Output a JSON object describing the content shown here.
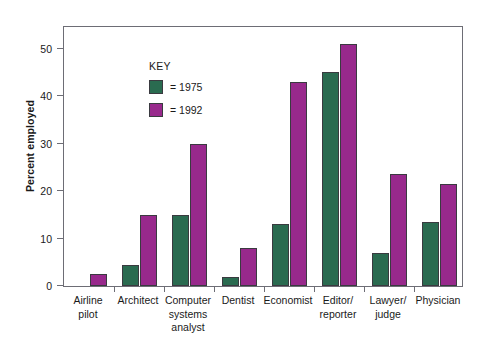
{
  "chart_data": {
    "type": "bar",
    "title": "",
    "xlabel": "",
    "ylabel": "Percent employed",
    "ylim": [
      0,
      55
    ],
    "yticks": [
      0,
      10,
      20,
      30,
      40,
      50
    ],
    "grid": false,
    "legend_position": "inside-top-left",
    "legend_title": "KEY",
    "categories": [
      "Airline pilot",
      "Architect",
      "Computer systems analyst",
      "Dentist",
      "Economist",
      "Editor/reporter",
      "Lawyer/judge",
      "Physician"
    ],
    "category_lines": [
      [
        "Airline",
        "pilot"
      ],
      [
        "Architect"
      ],
      [
        "Computer",
        "systems",
        "analyst"
      ],
      [
        "Dentist"
      ],
      [
        "Economist"
      ],
      [
        "Editor/",
        "reporter"
      ],
      [
        "Lawyer/",
        "judge"
      ],
      [
        "Physician"
      ]
    ],
    "series": [
      {
        "name": "= 1975",
        "key": "1975",
        "color": "#2a6b50",
        "values": [
          0,
          4.5,
          15,
          2,
          13,
          45,
          7,
          13.5
        ]
      },
      {
        "name": "= 1992",
        "key": "1992",
        "color": "#98298c",
        "values": [
          2.5,
          15,
          30,
          8,
          43,
          51,
          23.5,
          21.5
        ]
      }
    ]
  },
  "axis": {
    "tick_labels": [
      "50",
      "40",
      "30",
      "20",
      "10",
      "0"
    ]
  },
  "colors": {
    "series_1975": "#2a6b50",
    "series_1992": "#98298c",
    "frame": "#6d6d75",
    "bar_outline": "#3a3a40",
    "background": "#ffffff",
    "text": "#1a1a1a"
  }
}
